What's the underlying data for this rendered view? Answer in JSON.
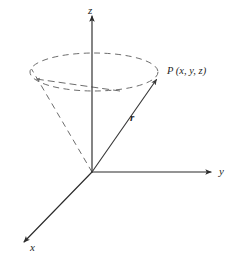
{
  "figure": {
    "labels": {
      "z_axis": "z",
      "y_axis": "y",
      "x_axis": "x",
      "vector": "r",
      "point": "P (x, y, z)"
    },
    "colors": {
      "axis": "#2b2b2b",
      "vector": "#3a3a3a",
      "dashed": "#6d6d6d",
      "background": "#ffffff",
      "text": "#1f1f1f"
    },
    "geometry": {
      "origin": [
        92,
        172
      ],
      "z_axis_tip": [
        92,
        14
      ],
      "y_axis_tip": [
        213,
        172
      ],
      "x_axis_tip": [
        22,
        244
      ],
      "point_p": [
        158,
        78
      ],
      "ellipse_center": [
        94,
        72
      ],
      "ellipse_rx": 64,
      "ellipse_ry": 19,
      "cone_left_generator_end": [
        31,
        70
      ]
    }
  }
}
